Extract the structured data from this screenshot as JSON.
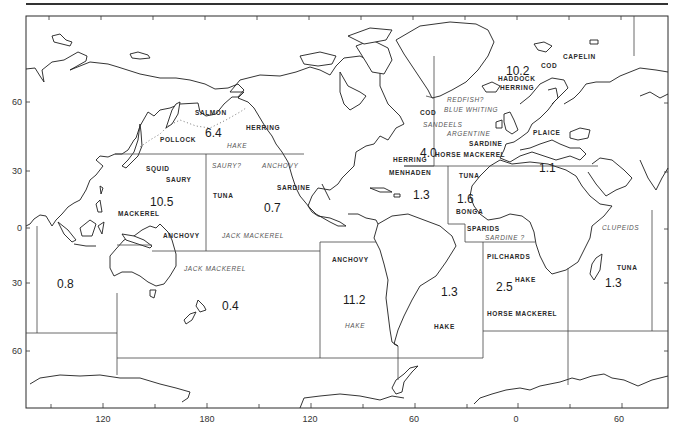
{
  "map": {
    "x_axis_labels": [
      {
        "text": "120",
        "x": 103
      },
      {
        "text": "180",
        "x": 207
      },
      {
        "text": "120",
        "x": 310
      },
      {
        "text": "60",
        "x": 414
      },
      {
        "text": "0",
        "x": 516
      },
      {
        "text": "60",
        "x": 619
      }
    ],
    "y_axis_labels": [
      {
        "text": "60",
        "y": 102
      },
      {
        "text": "30",
        "y": 171
      },
      {
        "text": "0",
        "y": 228
      },
      {
        "text": "30",
        "y": 283
      },
      {
        "text": "60",
        "y": 351
      }
    ],
    "regions": [
      {
        "name": "north-pacific",
        "catch": "6.4",
        "species": [
          {
            "text": "SALMON",
            "style": "bold"
          },
          {
            "text": "HERRING",
            "style": "bold"
          },
          {
            "text": "POLLOCK",
            "style": "bold"
          },
          {
            "text": "HAKE",
            "style": "italic"
          }
        ]
      },
      {
        "name": "northwest-pacific",
        "catch": "10.5",
        "species": [
          {
            "text": "SQUID",
            "style": "bold"
          },
          {
            "text": "SAURY",
            "style": "bold"
          },
          {
            "text": "MACKEREL",
            "style": "bold"
          },
          {
            "text": "ANCHOVY",
            "style": "bold"
          }
        ]
      },
      {
        "name": "eastern-central-pacific",
        "catch": "0.7",
        "species": [
          {
            "text": "SAURY?",
            "style": "italic"
          },
          {
            "text": "ANCHOVY",
            "style": "italic"
          },
          {
            "text": "SARDINE",
            "style": "bold"
          },
          {
            "text": "TUNA",
            "style": "bold"
          },
          {
            "text": "JACK MACKEREL",
            "style": "italic"
          }
        ]
      },
      {
        "name": "southwest-pacific",
        "catch": "0.4",
        "species": [
          {
            "text": "JACK MACKEREL",
            "style": "italic"
          }
        ]
      },
      {
        "name": "eastern-indian-ocean",
        "catch": "0.8",
        "species": []
      },
      {
        "name": "southeast-pacific",
        "catch": "11.2",
        "species": [
          {
            "text": "ANCHOVY",
            "style": "bold"
          },
          {
            "text": "HAKE",
            "style": "italic"
          }
        ]
      },
      {
        "name": "southwest-atlantic",
        "catch": "1.3",
        "species": [
          {
            "text": "HAKE",
            "style": "bold"
          }
        ]
      },
      {
        "name": "northeast-atlantic",
        "catch": "10.2",
        "species": [
          {
            "text": "CAPELIN",
            "style": "bold"
          },
          {
            "text": "COD",
            "style": "bold"
          },
          {
            "text": "HADDOCK",
            "style": "bold"
          },
          {
            "text": "HERRING",
            "style": "bold"
          },
          {
            "text": "REDFISH?",
            "style": "italic"
          },
          {
            "text": "BLUE WHITING",
            "style": "italic"
          },
          {
            "text": "PLAICE",
            "style": "bold"
          },
          {
            "text": "ARGENTINE",
            "style": "italic"
          },
          {
            "text": "SARDINE",
            "style": "bold"
          },
          {
            "text": "HORSE MACKEREL",
            "style": "bold"
          }
        ]
      },
      {
        "name": "northwest-atlantic",
        "catch": "4.0",
        "species": [
          {
            "text": "COD",
            "style": "bold"
          },
          {
            "text": "SANDEELS",
            "style": "italic"
          },
          {
            "text": "HERRING",
            "style": "bold"
          }
        ]
      },
      {
        "name": "mediterranean",
        "catch": "1.1",
        "species": []
      },
      {
        "name": "western-central-atlantic",
        "catch": "1.3",
        "species": [
          {
            "text": "MENHADEN",
            "style": "bold"
          }
        ]
      },
      {
        "name": "eastern-central-atlantic",
        "catch": "1.6",
        "species": [
          {
            "text": "TUNA",
            "style": "bold"
          },
          {
            "text": "BONGA",
            "style": "bold"
          },
          {
            "text": "SPARIDS",
            "style": "bold"
          },
          {
            "text": "SARDINE ?",
            "style": "italic"
          }
        ]
      },
      {
        "name": "southeast-atlantic",
        "catch": "2.5",
        "species": [
          {
            "text": "PILCHARDS",
            "style": "bold"
          },
          {
            "text": "HAKE",
            "style": "bold"
          },
          {
            "text": "HORSE MACKEREL",
            "style": "bold"
          }
        ]
      },
      {
        "name": "western-indian-ocean",
        "catch": "1.3",
        "species": [
          {
            "text": "CLUPEIDS",
            "style": "italic"
          },
          {
            "text": "TUNA",
            "style": "bold"
          }
        ]
      }
    ]
  }
}
